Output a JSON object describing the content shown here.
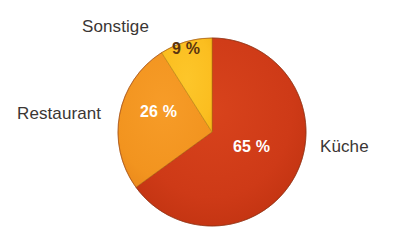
{
  "figure": {
    "background_color": "#ffffff",
    "label_color": "#3a3634"
  },
  "chart_data": {
    "type": "pie",
    "title": "",
    "subtitle": "",
    "xlabel": "",
    "ylabel": "",
    "grid": false,
    "legend_position": "outside-labels",
    "units": "%",
    "total": 100,
    "start_angle_deg": 0,
    "direction": "clockwise",
    "categories": [
      "Küche",
      "Restaurant",
      "Sonstige"
    ],
    "values": [
      65,
      26,
      9
    ],
    "value_labels": [
      "65 %",
      "26 %",
      "9 %"
    ],
    "colors": [
      "#ce3a17",
      "#f2941f",
      "#fbbe20"
    ],
    "slices": [
      {
        "name": "Küche",
        "value": 65,
        "value_label": "65 %",
        "color": "#ce3a17",
        "label_text_color": "#ffffff",
        "start_deg": 0,
        "end_deg": 234
      },
      {
        "name": "Restaurant",
        "value": 26,
        "value_label": "26 %",
        "color": "#f2941f",
        "label_text_color": "#ffffff",
        "start_deg": 234,
        "end_deg": 327.6
      },
      {
        "name": "Sonstige",
        "value": 9,
        "value_label": "9 %",
        "color": "#fbbe20",
        "label_text_color": "#5a3410",
        "start_deg": 327.6,
        "end_deg": 360
      }
    ]
  },
  "labels": {
    "sonstige": "Sonstige",
    "restaurant": "Restaurant",
    "kueche": "Küche"
  },
  "values": {
    "sonstige": "9 %",
    "restaurant": "26 %",
    "kueche": "65 %"
  }
}
